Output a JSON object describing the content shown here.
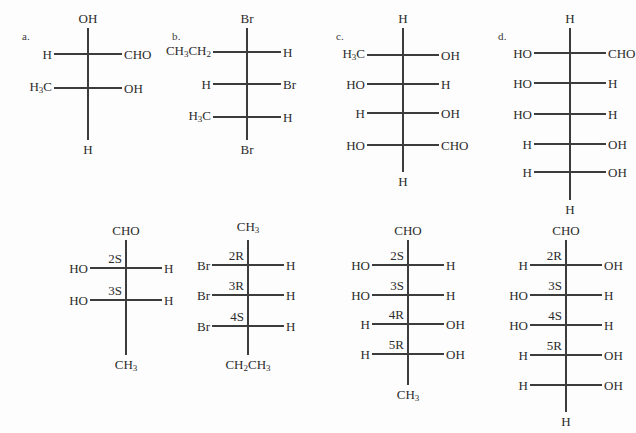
{
  "page": {
    "background": "#fdfdfd",
    "ink": "#2b2b2b",
    "bond_color": "#3c3c3c",
    "width": 636,
    "height": 433
  },
  "structures": [
    {
      "id": "a-top",
      "label": "a.",
      "label_x": 22,
      "label_y": 30,
      "spine_x": 88,
      "spine_top": 28,
      "spine_bottom": 140,
      "top_group": "OH",
      "bottom_group": "H",
      "rows": [
        {
          "y": 54,
          "left": "H",
          "right": "CHO",
          "stereo": ""
        },
        {
          "y": 88,
          "left": "H₃C",
          "right": "OH",
          "stereo": ""
        }
      ],
      "arm_left": 34,
      "arm_right": 34
    },
    {
      "id": "b-top",
      "label": "b.",
      "label_x": 172,
      "label_y": 30,
      "spine_x": 247,
      "spine_top": 28,
      "spine_bottom": 140,
      "top_group": "Br",
      "bottom_group": "Br",
      "rows": [
        {
          "y": 52,
          "left": "CH₃CH₂",
          "right": "H",
          "stereo": ""
        },
        {
          "y": 84,
          "left": "H",
          "right": "Br",
          "stereo": ""
        },
        {
          "y": 117,
          "left": "H₃C",
          "right": "H",
          "stereo": ""
        }
      ],
      "arm_left": 34,
      "arm_right": 34
    },
    {
      "id": "c-top",
      "label": "c.",
      "label_x": 336,
      "label_y": 30,
      "spine_x": 403,
      "spine_top": 28,
      "spine_bottom": 172,
      "top_group": "H",
      "bottom_group": "H",
      "rows": [
        {
          "y": 55,
          "left": "H₃C",
          "right": "OH",
          "stereo": ""
        },
        {
          "y": 84,
          "left": "HO",
          "right": "H",
          "stereo": ""
        },
        {
          "y": 113,
          "left": "H",
          "right": "OH",
          "stereo": ""
        },
        {
          "y": 145,
          "left": "HO",
          "right": "CHO",
          "stereo": ""
        }
      ],
      "arm_left": 36,
      "arm_right": 36
    },
    {
      "id": "d-top",
      "label": "d.",
      "label_x": 498,
      "label_y": 30,
      "spine_x": 570,
      "spine_top": 28,
      "spine_bottom": 200,
      "top_group": "H",
      "bottom_group": "H",
      "rows": [
        {
          "y": 53,
          "left": "HO",
          "right": "CHO",
          "stereo": ""
        },
        {
          "y": 83,
          "left": "HO",
          "right": "H",
          "stereo": ""
        },
        {
          "y": 114,
          "left": "HO",
          "right": "H",
          "stereo": ""
        },
        {
          "y": 144,
          "left": "H",
          "right": "OH",
          "stereo": ""
        },
        {
          "y": 172,
          "left": "H",
          "right": "OH",
          "stereo": ""
        }
      ],
      "arm_left": 36,
      "arm_right": 36
    },
    {
      "id": "a-bottom",
      "label": "",
      "label_x": 0,
      "label_y": 0,
      "spine_x": 126,
      "spine_top": 240,
      "spine_bottom": 355,
      "top_group": "CHO",
      "bottom_group": "CH₃",
      "rows": [
        {
          "y": 268,
          "left": "HO",
          "right": "H",
          "stereo": "2S"
        },
        {
          "y": 300,
          "left": "HO",
          "right": "H",
          "stereo": "3S"
        }
      ],
      "arm_left": 36,
      "arm_right": 36
    },
    {
      "id": "b-bottom",
      "label": "",
      "label_x": 0,
      "label_y": 0,
      "spine_x": 248,
      "spine_top": 240,
      "spine_bottom": 355,
      "top_group": "CH₃",
      "bottom_group": "CH₂CH₃",
      "rows": [
        {
          "y": 265,
          "left": "Br",
          "right": "H",
          "stereo": "2R"
        },
        {
          "y": 295,
          "left": "Br",
          "right": "H",
          "stereo": "3R"
        },
        {
          "y": 326,
          "left": "Br",
          "right": "H",
          "stereo": "4S"
        }
      ],
      "arm_left": 36,
      "arm_right": 36
    },
    {
      "id": "c-bottom",
      "label": "",
      "label_x": 0,
      "label_y": 0,
      "spine_x": 408,
      "spine_top": 240,
      "spine_bottom": 385,
      "top_group": "CHO",
      "bottom_group": "CH₃",
      "rows": [
        {
          "y": 265,
          "left": "HO",
          "right": "H",
          "stereo": "2S"
        },
        {
          "y": 295,
          "left": "HO",
          "right": "H",
          "stereo": "3S"
        },
        {
          "y": 324,
          "left": "H",
          "right": "OH",
          "stereo": "4R"
        },
        {
          "y": 354,
          "left": "H",
          "right": "OH",
          "stereo": "5R"
        }
      ],
      "arm_left": 36,
      "arm_right": 36
    },
    {
      "id": "d-bottom",
      "label": "",
      "label_x": 0,
      "label_y": 0,
      "spine_x": 566,
      "spine_top": 240,
      "spine_bottom": 412,
      "top_group": "CHO",
      "bottom_group": "H",
      "rows": [
        {
          "y": 265,
          "left": "H",
          "right": "OH",
          "stereo": "2R"
        },
        {
          "y": 295,
          "left": "HO",
          "right": "H",
          "stereo": "3S"
        },
        {
          "y": 325,
          "left": "HO",
          "right": "H",
          "stereo": "4S"
        },
        {
          "y": 355,
          "left": "H",
          "right": "OH",
          "stereo": "5R"
        },
        {
          "y": 385,
          "left": "H",
          "right": "OH",
          "stereo": ""
        }
      ],
      "arm_left": 36,
      "arm_right": 36
    }
  ]
}
